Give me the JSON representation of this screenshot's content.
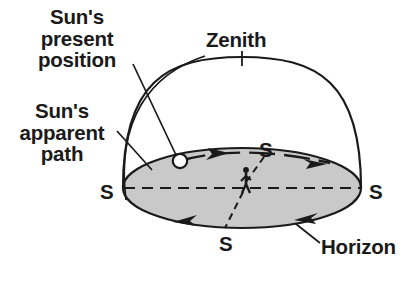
{
  "diagram": {
    "labels": {
      "sun_present_position": "Sun's\npresent\nposition",
      "sun_apparent_path": "Sun's\napparent\npath",
      "zenith": "Zenith",
      "horizon": "Horizon",
      "cardinal_west": "S",
      "cardinal_north": "S",
      "cardinal_east": "S",
      "cardinal_south": "S"
    },
    "colors": {
      "stroke": "#1a1a1a",
      "horizon_plane_fill": "#c9c9c9",
      "sun_marker_fill": "#ffffff",
      "background": "#ffffff",
      "text": "#1a1a1a"
    },
    "geometry": {
      "horizon_plane": {
        "center_x": 242,
        "center_y": 188,
        "radius_x": 119,
        "radius_y": 40
      },
      "celestial_dome": {
        "left_x": 123,
        "right_x": 361,
        "apex_x": 242,
        "apex_y": 67
      },
      "sun_marker": {
        "center_x": 180,
        "center_y": 161,
        "radius": 7
      },
      "observer": {
        "x": 246,
        "y": 182
      }
    },
    "annotations": {
      "direction_arrows": 4,
      "arrow_direction": "clockwise-viewed-from-above",
      "meridian_dashed": true,
      "east_west_dashed": true
    }
  }
}
